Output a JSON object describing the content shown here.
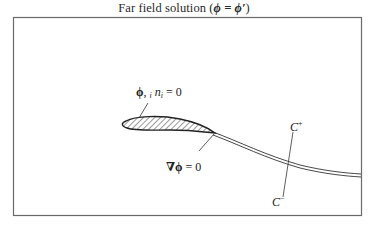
{
  "title": {
    "prefix": "Far field solution (",
    "math": "ϕ = ϕ′",
    "suffix": ")"
  },
  "labels": {
    "surface_condition": {
      "phi": "ϕ",
      "comma_i": ", ",
      "sub_i": "i",
      "n": "n",
      "sub_n": "i",
      "equals": " = 0"
    },
    "gradient_condition": {
      "nabla_phi": "∇ϕ",
      "equals": " = 0"
    },
    "cut_upper": {
      "C": "C",
      "sup": "+"
    },
    "cut_lower": {
      "C": "C",
      "sup": "−"
    }
  },
  "colors": {
    "stroke": "#2a2a2a",
    "frame": "#6a6a6a",
    "background": "#ffffff"
  }
}
